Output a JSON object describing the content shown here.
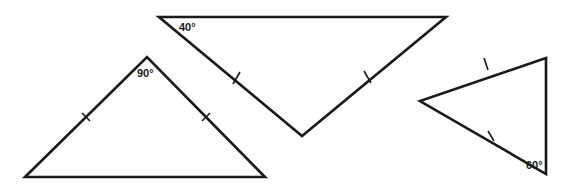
{
  "diagram": {
    "stroke_color": "#1a1a1a",
    "background": "#ffffff",
    "triangles": [
      {
        "id": "left",
        "vertices": [
          [
            25,
            177
          ],
          [
            147,
            57
          ],
          [
            265,
            177
          ]
        ],
        "angle_label": "90°",
        "angle_vertex": "apex",
        "label_pos": [
          137,
          77
        ],
        "congruent_sides": [
          [
            0,
            1
          ],
          [
            1,
            2
          ]
        ]
      },
      {
        "id": "middle",
        "vertices": [
          [
            159,
            17
          ],
          [
            446,
            17
          ],
          [
            302,
            136
          ]
        ],
        "angle_label": "40°",
        "angle_vertex": "top-left",
        "label_pos": [
          179,
          31
        ],
        "congruent_sides": [
          [
            0,
            2
          ],
          [
            1,
            2
          ]
        ]
      },
      {
        "id": "right",
        "vertices": [
          [
            546,
            58
          ],
          [
            420,
            101
          ],
          [
            546,
            174
          ]
        ],
        "angle_label": "60°",
        "angle_vertex": "bottom-right",
        "label_pos": [
          527,
          170
        ],
        "congruent_sides": [
          [
            0,
            1
          ],
          [
            1,
            2
          ]
        ]
      }
    ]
  },
  "labels": {
    "left_angle": "90°",
    "middle_angle": "40°",
    "right_angle": "60°"
  }
}
